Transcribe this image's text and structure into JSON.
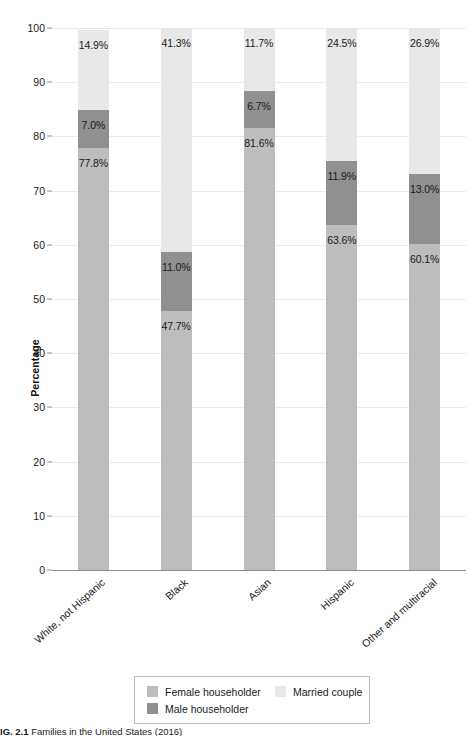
{
  "caption": {
    "number": "IG. 2.1",
    "text": "Families in the United States (2016)"
  },
  "colors": {
    "married_couple": "#e8e8e8",
    "male_householder": "#909090",
    "female_householder": "#bdbdbd",
    "gridline": "#e9eaec",
    "axis": "#8a8d91"
  },
  "legend": {
    "entries": [
      {
        "label": "Female householder",
        "key": "female_householder"
      },
      {
        "label": "Married couple",
        "key": "married_couple"
      },
      {
        "label": "Male householder",
        "key": "male_householder"
      }
    ]
  },
  "chart_data": {
    "type": "bar",
    "subtype": "stacked-bar-100",
    "title": "",
    "xlabel": "",
    "ylabel": "Percentage",
    "ylim": [
      0,
      100
    ],
    "yticks": [
      0,
      10,
      20,
      30,
      40,
      50,
      60,
      70,
      80,
      90,
      100
    ],
    "ytick_labels": [
      "0",
      "10",
      "20",
      "30",
      "40",
      "50",
      "60",
      "70",
      "80",
      "90",
      "100"
    ],
    "grid": true,
    "legend_position": "bottom",
    "categories": [
      "White, not Hispanic",
      "Black",
      "Asian",
      "Hispanic",
      "Other and multiracial"
    ],
    "series": [
      {
        "name": "Female householder",
        "values": [
          77.8,
          47.7,
          81.6,
          63.6,
          60.1
        ],
        "labels": [
          "77.8%",
          "47.7%",
          "81.6%",
          "63.6%",
          "60.1%"
        ]
      },
      {
        "name": "Male householder",
        "values": [
          7.0,
          11.0,
          6.7,
          11.9,
          13.0
        ],
        "labels": [
          "7.0%",
          "11.0%",
          "6.7%",
          "11.9%",
          "13.0%"
        ]
      },
      {
        "name": "Married couple",
        "values": [
          14.9,
          41.3,
          11.7,
          24.5,
          26.9
        ],
        "labels": [
          "14.9%",
          "41.3%",
          "11.7%",
          "24.5%",
          "26.9%"
        ]
      }
    ]
  }
}
